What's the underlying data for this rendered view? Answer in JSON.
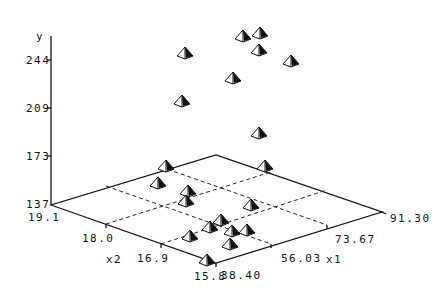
{
  "chart_data": {
    "type": "scatter",
    "subtype": "3d-scatter",
    "title": "",
    "zlabel": "y",
    "xlabel": "x1",
    "ylabel": "x2",
    "axes": {
      "y": {
        "label": "y",
        "ticks": [
          "137",
          "173",
          "209",
          "244"
        ],
        "range": [
          137,
          264
        ]
      },
      "x1": {
        "label": "x1",
        "ticks": [
          "38.40",
          "56.03",
          "73.67",
          "91.30"
        ],
        "range": [
          38.4,
          91.3
        ]
      },
      "x2": {
        "label": "x2",
        "ticks": [
          "19.1",
          "18.0",
          "16.9",
          "15.8"
        ],
        "range": [
          15.8,
          19.1
        ]
      }
    },
    "grid": true,
    "legend": null,
    "marker": "pyramid",
    "points_screen": [
      {
        "sx": 185,
        "sy": 53,
        "floor": false
      },
      {
        "sx": 243,
        "sy": 36,
        "floor": false
      },
      {
        "sx": 260,
        "sy": 33,
        "floor": false
      },
      {
        "sx": 259,
        "sy": 50,
        "floor": false
      },
      {
        "sx": 291,
        "sy": 61,
        "floor": false
      },
      {
        "sx": 233,
        "sy": 78,
        "floor": false
      },
      {
        "sx": 182,
        "sy": 101,
        "floor": false
      },
      {
        "sx": 259,
        "sy": 133,
        "floor": false
      },
      {
        "sx": 166,
        "sy": 166,
        "floor": true
      },
      {
        "sx": 265,
        "sy": 166,
        "floor": true
      },
      {
        "sx": 158,
        "sy": 183,
        "floor": true
      },
      {
        "sx": 188,
        "sy": 191,
        "floor": true
      },
      {
        "sx": 186,
        "sy": 201,
        "floor": true
      },
      {
        "sx": 251,
        "sy": 205,
        "floor": true
      },
      {
        "sx": 221,
        "sy": 220,
        "floor": true
      },
      {
        "sx": 210,
        "sy": 227,
        "floor": true
      },
      {
        "sx": 232,
        "sy": 231,
        "floor": true
      },
      {
        "sx": 247,
        "sy": 230,
        "floor": true
      },
      {
        "sx": 190,
        "sy": 236,
        "floor": true
      },
      {
        "sx": 230,
        "sy": 244,
        "floor": true
      },
      {
        "sx": 207,
        "sy": 260,
        "floor": true
      }
    ]
  },
  "labels": {
    "y_axis_title": "y",
    "y_ticks": [
      "244",
      "209",
      "173",
      "137"
    ],
    "x2_title": "x2",
    "x2_ticks": [
      "19.1",
      "18.0",
      "16.9",
      "15.8"
    ],
    "x1_title": "x1",
    "x1_ticks": [
      "38.40",
      "56.03",
      "73.67",
      "91.30"
    ]
  }
}
